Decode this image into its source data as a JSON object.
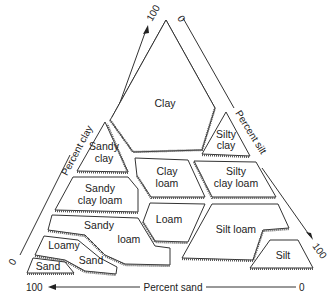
{
  "diagram": {
    "axes": {
      "clay": {
        "label": "Percent clay",
        "start": "0",
        "end": "100"
      },
      "silt": {
        "label": "Percent silt",
        "start": "0",
        "end": "100"
      },
      "sand": {
        "label": "Percent sand",
        "start": "100",
        "end": "0"
      }
    },
    "regions": [
      {
        "id": "clay",
        "lines": [
          "Clay"
        ]
      },
      {
        "id": "sandy-clay",
        "lines": [
          "Sandy",
          "clay"
        ]
      },
      {
        "id": "silty-clay",
        "lines": [
          "Silty",
          "clay"
        ]
      },
      {
        "id": "sandy-clay-loam",
        "lines": [
          "Sandy",
          "clay loam"
        ]
      },
      {
        "id": "clay-loam",
        "lines": [
          "Clay",
          "loam"
        ]
      },
      {
        "id": "silty-clay-loam",
        "lines": [
          "Silty",
          "clay loam"
        ]
      },
      {
        "id": "sandy-loam",
        "lines": [
          "Sandy",
          "loam"
        ]
      },
      {
        "id": "loam",
        "lines": [
          "Loam"
        ]
      },
      {
        "id": "silt-loam",
        "lines": [
          "Silt loam"
        ]
      },
      {
        "id": "loamy-sand",
        "lines": [
          "Loamy",
          "Sand"
        ]
      },
      {
        "id": "sand",
        "lines": [
          "Sand"
        ]
      },
      {
        "id": "silt",
        "lines": [
          "Silt"
        ]
      }
    ]
  }
}
